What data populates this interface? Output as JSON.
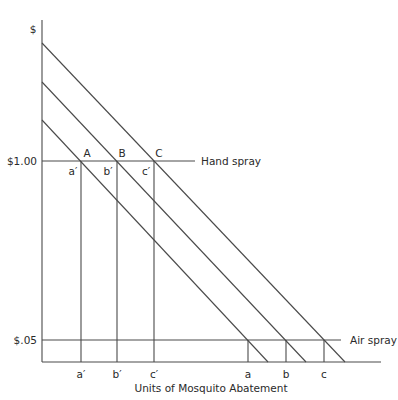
{
  "diagram": {
    "title": "Units of Mosquito Abatement",
    "y_axis_label": "$",
    "price_levels": [
      {
        "label": "$1.00",
        "line_label": "Hand spray"
      },
      {
        "label": "$.05",
        "line_label": "Air spray"
      }
    ],
    "demand_curves": [
      "lowest",
      "middle",
      "highest"
    ],
    "intersection_points": {
      "hand_spray": [
        "A",
        "B",
        "C"
      ],
      "hand_spray_quantities": [
        "a′",
        "b′",
        "c′"
      ]
    },
    "x_tick_labels": [
      "a′",
      "b′",
      "c′",
      "a",
      "b",
      "c"
    ],
    "colors": {
      "line": "#4a4a4a",
      "text": "#2a2a2a",
      "background": "#ffffff"
    }
  }
}
